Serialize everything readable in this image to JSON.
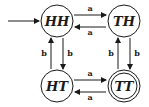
{
  "diagram": {
    "type": "finite-automaton",
    "colors": {
      "stroke": "#1a1a1a",
      "background": "#ffffff"
    },
    "start_state": "HH",
    "accepting_states": [
      "TT"
    ],
    "states": [
      {
        "id": "HH",
        "label": "HH"
      },
      {
        "id": "TH",
        "label": "TH"
      },
      {
        "id": "HT",
        "label": "HT"
      },
      {
        "id": "TT",
        "label": "TT"
      }
    ],
    "transitions": [
      {
        "from": "HH",
        "to": "TH",
        "label": "a"
      },
      {
        "from": "TH",
        "to": "HH",
        "label": "a"
      },
      {
        "from": "HT",
        "to": "TT",
        "label": "a"
      },
      {
        "from": "TT",
        "to": "HT",
        "label": "a"
      },
      {
        "from": "HT",
        "to": "HH",
        "label": "b"
      },
      {
        "from": "HH",
        "to": "HT",
        "label": "b"
      },
      {
        "from": "TT",
        "to": "TH",
        "label": "b"
      },
      {
        "from": "TH",
        "to": "TT",
        "label": "b"
      }
    ]
  }
}
